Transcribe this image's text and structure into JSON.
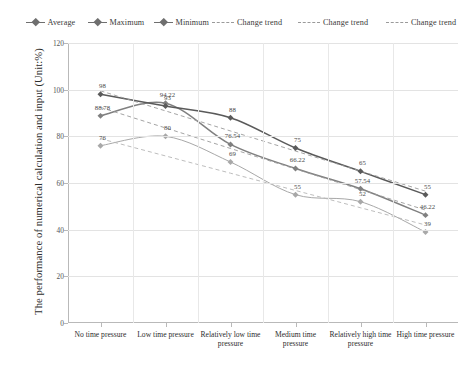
{
  "chart_data": {
    "type": "line",
    "title": "",
    "xlabel": "",
    "ylabel": "The performance of numerical calculation and input (Unit:%)",
    "ylim": [
      0,
      120
    ],
    "yticks": [
      0,
      20,
      40,
      60,
      80,
      100,
      120
    ],
    "grid": true,
    "legend_position": "top",
    "categories": [
      "No time pressure",
      "Low time pressure",
      "Relatively low time pressure",
      "Medium time pressure",
      "Relatively high time pressure",
      "High time pressure"
    ],
    "series": [
      {
        "name": "Average",
        "style": "solid",
        "color": "#808080",
        "values": [
          88.78,
          94.22,
          76.54,
          66.22,
          57.54,
          46.22
        ],
        "labels": [
          "88.78",
          "94.22",
          "76.54",
          "66.22",
          "57.54",
          "46.22"
        ]
      },
      {
        "name": "Maximum",
        "style": "solid",
        "color": "#5a5a5a",
        "values": [
          98,
          93,
          88,
          75,
          65,
          55
        ],
        "labels": [
          "98",
          "93",
          "88",
          "75",
          "65",
          "55"
        ]
      },
      {
        "name": "Minimum",
        "style": "solid",
        "color": "#a8a8a8",
        "values": [
          76,
          80,
          69,
          55,
          52,
          39
        ],
        "labels": [
          "76",
          "80",
          "69",
          "55",
          "52",
          "39"
        ]
      },
      {
        "name": "Change trend",
        "style": "dashed",
        "color": "#9a9a9a",
        "trend_for": "Maximum",
        "values": [
          99.5,
          90.9,
          82.3,
          73.7,
          65.1,
          56.5
        ]
      },
      {
        "name": "Change trend",
        "style": "dashed",
        "color": "#9a9a9a",
        "trend_for": "Average",
        "values": [
          92.4,
          83.6,
          74.8,
          66.0,
          57.2,
          48.4
        ]
      },
      {
        "name": "Change trend",
        "style": "dashed",
        "color": "#b5b5b5",
        "trend_for": "Minimum",
        "values": [
          79.0,
          71.6,
          64.2,
          56.8,
          49.4,
          42.0
        ]
      }
    ]
  },
  "legend": {
    "items": [
      {
        "label": "Average",
        "style": "solid"
      },
      {
        "label": "Maximum",
        "style": "solid"
      },
      {
        "label": "Minimum",
        "style": "solid"
      },
      {
        "label": "Change trend",
        "style": "dashed"
      },
      {
        "label": "Change trend",
        "style": "dashed"
      },
      {
        "label": "Change trend",
        "style": "dashed"
      }
    ]
  },
  "axis": {
    "y_title": "The performance of numerical calculation and input (Unit:%)",
    "y_ticks": [
      "0",
      "20",
      "40",
      "60",
      "80",
      "100",
      "120"
    ]
  }
}
